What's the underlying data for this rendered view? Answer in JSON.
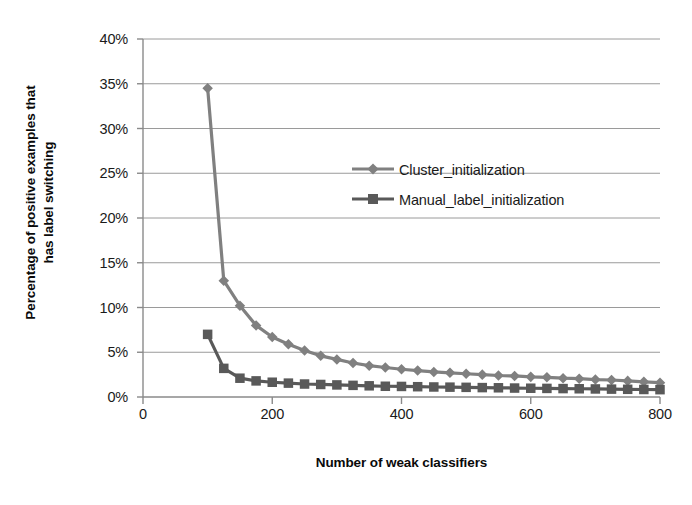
{
  "chart_data": {
    "type": "line",
    "title": "",
    "xlabel": "Number of weak classifiers",
    "ylabel_line1": "Percentage of positive examples that",
    "ylabel_line2": "has label switching",
    "xlim": [
      0,
      800
    ],
    "ylim": [
      0,
      40
    ],
    "xticks": [
      0,
      200,
      400,
      600,
      800
    ],
    "xtick_labels": [
      "0",
      "200",
      "400",
      "600",
      "800"
    ],
    "yticks": [
      0,
      5,
      10,
      15,
      20,
      25,
      30,
      35,
      40
    ],
    "ytick_labels": [
      "0%",
      "5%",
      "10%",
      "15%",
      "20%",
      "25%",
      "30%",
      "35%",
      "40%"
    ],
    "grid": "horizontal",
    "legend_position": "center-right-inside",
    "x": [
      100,
      125,
      150,
      175,
      200,
      225,
      250,
      275,
      300,
      325,
      350,
      375,
      400,
      425,
      450,
      475,
      500,
      525,
      550,
      575,
      600,
      625,
      650,
      675,
      700,
      725,
      750,
      775,
      800
    ],
    "series": [
      {
        "name": "Cluster_initialization",
        "marker": "diamond",
        "color": "#808080",
        "values": [
          34.5,
          13.0,
          10.2,
          8.0,
          6.7,
          5.9,
          5.2,
          4.6,
          4.2,
          3.8,
          3.5,
          3.3,
          3.1,
          2.95,
          2.8,
          2.7,
          2.6,
          2.5,
          2.4,
          2.35,
          2.25,
          2.2,
          2.1,
          2.05,
          1.95,
          1.9,
          1.8,
          1.7,
          1.6
        ]
      },
      {
        "name": "Manual_label_initialization",
        "marker": "square",
        "color": "#595959",
        "values": [
          7.0,
          3.2,
          2.1,
          1.8,
          1.65,
          1.55,
          1.45,
          1.4,
          1.35,
          1.3,
          1.25,
          1.2,
          1.18,
          1.15,
          1.12,
          1.1,
          1.08,
          1.05,
          1.03,
          1.0,
          0.98,
          0.96,
          0.94,
          0.92,
          0.9,
          0.88,
          0.86,
          0.84,
          0.82
        ]
      }
    ]
  },
  "legend": {
    "items": [
      {
        "label": "Cluster_initialization",
        "marker": "diamond",
        "color": "#808080"
      },
      {
        "label": "Manual_label_initialization",
        "marker": "square",
        "color": "#595959"
      }
    ]
  },
  "axes": {
    "grid_color": "#9a9a9a",
    "axis_color": "#8a8a8a"
  }
}
